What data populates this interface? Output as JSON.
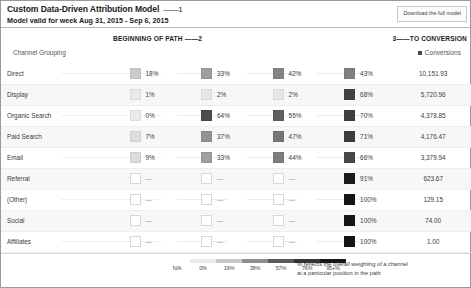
{
  "header": {
    "title": "Custom Data-Driven Attribution Model",
    "annotation_1": "——1",
    "subtitle": "Model valid for week Aug 31, 2015 - Sep 6, 2015",
    "download_label": "Download the full model"
  },
  "path": {
    "beginning_label": "BEGINNING OF PATH ——2",
    "to_conversion_label": "3——TO CONVERSION",
    "channel_head": "Channel Grouping",
    "conversions_head": "Conversions"
  },
  "legend": {
    "ticks": [
      "N/A",
      "0%",
      "19%",
      "38%",
      "57%",
      "76%",
      "95+%"
    ],
    "swatches": [
      "#ffffff",
      "#ebebeb",
      "#c9c9c9",
      "#8f8f8f",
      "#5a5a5a",
      "#333333",
      "#161616"
    ],
    "note_line1": "% reflects the overall weighting of a channel",
    "note_line2": "at a particular position in the path"
  },
  "chart_data": {
    "type": "heatmap",
    "title": "Custom Data-Driven Attribution Model",
    "subtitle": "Model valid for week Aug 31, 2015 - Sep 6, 2015",
    "xlabel": "Path position (beginning of path → to conversion)",
    "ylabel": "Channel Grouping",
    "categories": [
      "Direct",
      "Display",
      "Organic Search",
      "Paid Search",
      "Email",
      "Referral",
      "(Other)",
      "Social",
      "Affiliates"
    ],
    "columns": [
      "position-1",
      "position-2",
      "position-3",
      "position-4",
      "Conversions"
    ],
    "legend_scale": [
      "N/A",
      "0%",
      "19%",
      "38%",
      "57%",
      "76%",
      "95+%"
    ],
    "rows": [
      {
        "channel": "Direct",
        "p1": "18%",
        "p2": "33%",
        "p3": "42%",
        "p4": "43%",
        "p1v": 18,
        "p2v": 33,
        "p3v": 42,
        "p4v": 43,
        "conversions": "10,151.93",
        "conversions_value": 10151.93
      },
      {
        "channel": "Display",
        "p1": "1%",
        "p2": "2%",
        "p3": "2%",
        "p4": "68%",
        "p1v": 1,
        "p2v": 2,
        "p3v": 2,
        "p4v": 68,
        "conversions": "5,720.96",
        "conversions_value": 5720.96
      },
      {
        "channel": "Organic Search",
        "p1": "0%",
        "p2": "64%",
        "p3": "55%",
        "p4": "70%",
        "p1v": 0,
        "p2v": 64,
        "p3v": 55,
        "p4v": 70,
        "conversions": "4,378.85",
        "conversions_value": 4378.85
      },
      {
        "channel": "Paid Search",
        "p1": "7%",
        "p2": "37%",
        "p3": "47%",
        "p4": "71%",
        "p1v": 7,
        "p2v": 37,
        "p3v": 47,
        "p4v": 71,
        "conversions": "4,176.47",
        "conversions_value": 4176.47
      },
      {
        "channel": "Email",
        "p1": "9%",
        "p2": "33%",
        "p3": "44%",
        "p4": "66%",
        "p1v": 9,
        "p2v": 33,
        "p3v": 44,
        "p4v": 66,
        "conversions": "3,379.94",
        "conversions_value": 3379.94
      },
      {
        "channel": "Referral",
        "p1": "—",
        "p2": "—",
        "p3": "—",
        "p4": "91%",
        "p1v": null,
        "p2v": null,
        "p3v": null,
        "p4v": 91,
        "conversions": "623.67",
        "conversions_value": 623.67
      },
      {
        "channel": "(Other)",
        "p1": "—",
        "p2": "—",
        "p3": "—",
        "p4": "100%",
        "p1v": null,
        "p2v": null,
        "p3v": null,
        "p4v": 100,
        "conversions": "129.15",
        "conversions_value": 129.15
      },
      {
        "channel": "Social",
        "p1": "—",
        "p2": "—",
        "p3": "—",
        "p4": "100%",
        "p1v": null,
        "p2v": null,
        "p3v": null,
        "p4v": 100,
        "conversions": "74.00",
        "conversions_value": 74.0
      },
      {
        "channel": "Affiliates",
        "p1": "—",
        "p2": "—",
        "p3": "—",
        "p4": "100%",
        "p1v": null,
        "p2v": null,
        "p3v": null,
        "p4v": 100,
        "conversions": "1.00",
        "conversions_value": 1.0
      }
    ]
  }
}
